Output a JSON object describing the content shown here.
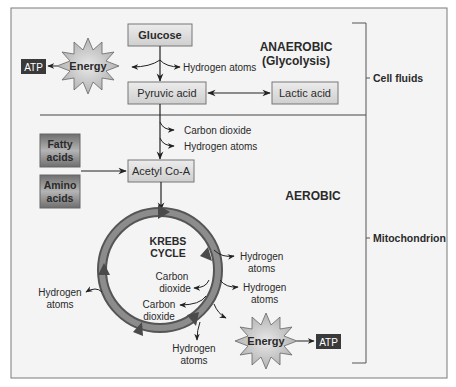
{
  "diagram": {
    "regions": {
      "anaerobic_title": "ANAEROBIC",
      "anaerobic_subtitle": "(Glycolysis)",
      "aerobic_title": "AEROBIC",
      "cell_fluids": "Cell fluids",
      "mitochondrion": "Mitochondrion"
    },
    "nodes": {
      "glucose": "Glucose",
      "pyruvic_acid": "Pyruvic acid",
      "lactic_acid": "Lactic acid",
      "acetyl_coa": "Acetyl Co-A",
      "fatty_acids_1": "Fatty",
      "fatty_acids_2": "acids",
      "amino_acids_1": "Amino",
      "amino_acids_2": "acids",
      "energy_top": "Energy",
      "energy_bottom": "Energy",
      "atp_top": "ATP",
      "atp_bottom": "ATP",
      "krebs_1": "KREBS",
      "krebs_2": "CYCLE"
    },
    "labels": {
      "h_atoms_glycolysis": "Hydrogen atoms",
      "co2_pyruvate": "Carbon dioxide",
      "h_atoms_pyruvate": "Hydrogen atoms",
      "h_right1_a": "Hydrogen",
      "h_right1_b": "atoms",
      "h_right2_a": "Hydrogen",
      "h_right2_b": "atoms",
      "h_bottom_a": "Hydrogen",
      "h_bottom_b": "atoms",
      "h_left_a": "Hydrogen",
      "h_left_b": "atoms",
      "co2_inner1_a": "Carbon",
      "co2_inner1_b": "dioxide",
      "co2_inner2_a": "Carbon",
      "co2_inner2_b": "dioxide"
    },
    "colors": {
      "panel_bg": "#f4f4f4",
      "box_fill_light": "#e2e2e2",
      "box_fill_dark": "#8a8a8a",
      "atp_fill": "#3a3a3a",
      "ring": "#7a7a7a",
      "line": "#333333"
    }
  }
}
